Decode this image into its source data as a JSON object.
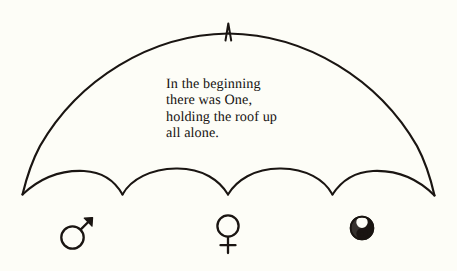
{
  "figure": {
    "background_color": "#fdfdf7",
    "ink_color": "#1a1512",
    "caption": {
      "text": "In the beginning\nthere was One,\nholding the roof up\nall alone.",
      "lines": [
        "In the beginning",
        "there was One,",
        "holding the roof up",
        "all alone."
      ]
    },
    "umbrella": {
      "name": "umbrella-canopy",
      "apex_finial": "spike",
      "apex_point": [
        228,
        27
      ],
      "left_tip": [
        22,
        194
      ],
      "right_tip": [
        434,
        195
      ],
      "scallop_count": 4,
      "scallop_cusps": [
        [
          22,
          194
        ],
        [
          122,
          194
        ],
        [
          228,
          194
        ],
        [
          332,
          194
        ],
        [
          434,
          195
        ]
      ],
      "stroke_width": 2.1
    },
    "symbols": [
      {
        "name": "mars-symbol",
        "glyph": "♂",
        "label": "Mars",
        "center": [
          73,
          237
        ],
        "radius": 11
      },
      {
        "name": "venus-symbol",
        "glyph": "♀",
        "label": "Venus",
        "center": [
          228,
          226
        ],
        "radius": 10
      },
      {
        "name": "yin-yang-symbol",
        "glyph": "☯",
        "label": "Yin Yang",
        "center": [
          362,
          228
        ],
        "radius": 11
      }
    ]
  }
}
